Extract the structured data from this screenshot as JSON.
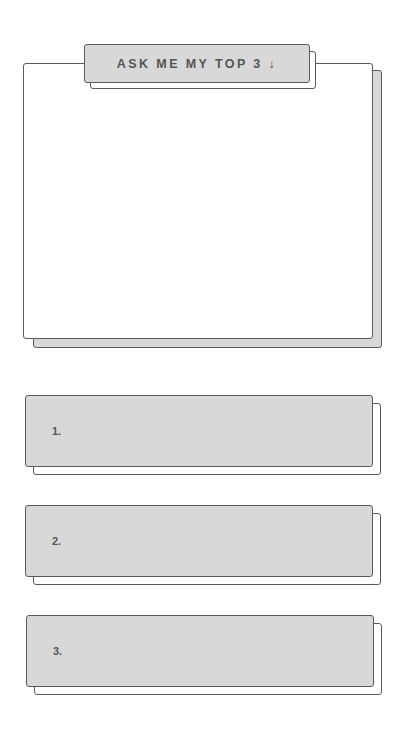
{
  "title": {
    "label": "ASK ME MY TOP 3 ↓"
  },
  "main_card": {
    "content": ""
  },
  "answers": [
    {
      "number": "1.",
      "value": ""
    },
    {
      "number": "2.",
      "value": ""
    },
    {
      "number": "3.",
      "value": ""
    }
  ],
  "colors": {
    "card_fill": "#ffffff",
    "box_fill": "#d8d8d8",
    "border": "#5a5a5a",
    "text": "#555555"
  }
}
